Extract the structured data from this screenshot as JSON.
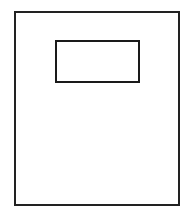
{
  "diagram": {
    "shapes": [
      {
        "name": "page-outline",
        "type": "rectangle",
        "x": 14,
        "y": 11,
        "width": 166,
        "height": 195,
        "stroke": "#222222"
      },
      {
        "name": "label-box",
        "type": "rectangle",
        "x": 55,
        "y": 40,
        "width": 85,
        "height": 43,
        "stroke": "#1a1a1a"
      }
    ],
    "colors": {
      "background": "#ffffff",
      "stroke": "#222222"
    }
  }
}
